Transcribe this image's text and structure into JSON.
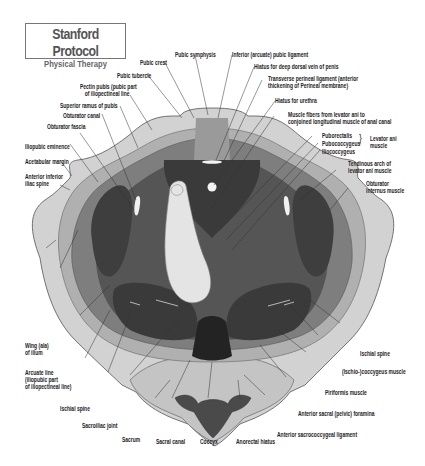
{
  "title": {
    "main": "Stanford Protocol",
    "sub": "Physical Therapy"
  },
  "colors": {
    "bone_light": "#d2d2d2",
    "bone_mid": "#b4b4b4",
    "muscle_mid": "#7e7e7e",
    "muscle_dark": "#555555",
    "muscle_darker": "#3e3e3e",
    "deep_dark": "#2a2a2a",
    "finger": "#e4e4e4",
    "line": "#333333"
  },
  "labels": {
    "pubic_symphysis": "Pubic symphysis",
    "pubic_crest": "Pubic crest",
    "pubic_tubercle": "Pubic tubercle",
    "pectin_pubis_1": "Pectin pubis (pubic part",
    "pectin_pubis_2": "of iliopectineal line",
    "superior_ramus": "Superior ramus of pubis",
    "obturator_canal": "Obturator canal",
    "obturator_fascia": "Obturator fascia",
    "iliopubic_eminence": "Iliopubic eminence",
    "acetabular_margin": "Acetabular margin",
    "anterior_inferior_1": "Anterior inferior",
    "anterior_inferior_2": "iliac spine",
    "inferior_pubic_ligament": "Inferior (arcuate) pubic ligament",
    "hiatus_dorsal_vein": "Hiatus for deep dorsal vein of penis",
    "transverse_perineal_1": "Transverse perineal ligament (anterior",
    "transverse_perineal_2": "thickening of Perineal membrane)",
    "hiatus_urethra": "Hiatus for urethra",
    "muscle_fibers_1": "Muscle fibers from levator ani to",
    "muscle_fibers_2": "conjoined longitudinal muscle of anal canal",
    "puborectalis": "Puborectalis",
    "pubococcygeus": "Pubococcygeus",
    "iliococcygeus": "Iliococcygeus",
    "levator_ani_1": "Levator ani",
    "levator_ani_2": "muscle",
    "tendinous_arch_1": "Tendinous arch of",
    "tendinous_arch_2": "levator ani muscle",
    "obturator_internus_1": "Obturator",
    "obturator_internus_2": "internus muscle",
    "wing_ilium_1": "Wing (ala)",
    "wing_ilium_2": "of ilium",
    "arcuate_line_1": "Arcuate line",
    "arcuate_line_2": "(iliopubic part",
    "arcuate_line_3": "of iliopectineal line)",
    "ischial_spine_left": "Ischial spine",
    "sacroiliac_joint": "Sacroiliac joint",
    "sacrum": "Sacrum",
    "sacral_canal": "Sacral canal",
    "coccyx": "Coccyx",
    "anorectal_hiatus": "Anorectal hiatus",
    "anterior_sacrococcygeal": "Anterior sacrococcygeal ligament",
    "anterior_sacral_foramina": "Anterior sacral (pelvic) foramina",
    "piriformis": "Piriformis muscle",
    "ischiococcygeus": "(Ischio-)coccygeus muscle",
    "ischial_spine_right": "Ischial spine"
  }
}
